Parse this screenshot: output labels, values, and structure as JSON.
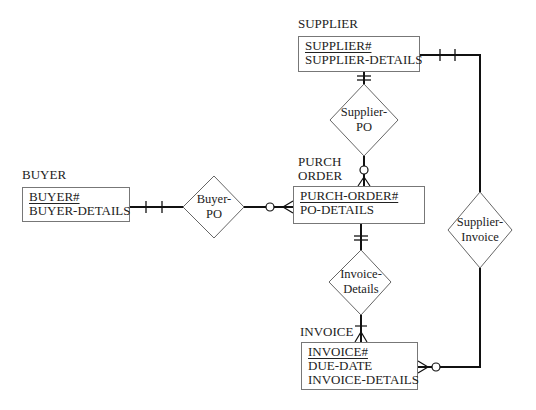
{
  "entities": {
    "supplier": {
      "label": "SUPPLIER",
      "key": "SUPPLIER#",
      "attributes": [
        "SUPPLIER-DETAILS"
      ]
    },
    "buyer": {
      "label": "BUYER",
      "key": "BUYER#",
      "attributes": [
        "BUYER-DETAILS"
      ]
    },
    "purch_order": {
      "label_line1": "PURCH",
      "label_line2": "ORDER",
      "key": "PURCH-ORDER#",
      "attributes": [
        "PO-DETAILS"
      ]
    },
    "invoice": {
      "label": "INVOICE",
      "key": "INVOICE#",
      "attributes": [
        "DUE-DATE",
        "INVOICE-DETAILS"
      ]
    }
  },
  "relationships": {
    "supplier_po": {
      "line1": "Supplier-",
      "line2": "PO"
    },
    "buyer_po": {
      "line1": "Buyer-",
      "line2": "PO"
    },
    "invoice_details": {
      "line1": "Invoice-",
      "line2": "Details"
    },
    "supplier_invoice": {
      "line1": "Supplier-",
      "line2": "Invoice"
    }
  },
  "colors": {
    "line": "#111111",
    "box_border": "#777777",
    "diamond_border": "#666666"
  }
}
